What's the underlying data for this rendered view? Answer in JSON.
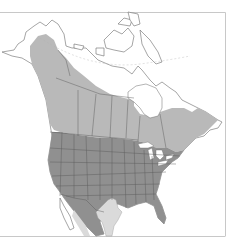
{
  "map": {
    "type": "species-range-map",
    "region": "North America",
    "background_color": "#ffffff",
    "outline_color": "#5a5a5a",
    "frame_color": "#c8c8c8",
    "zones": [
      {
        "id": "northern-range",
        "description": "Canada and Alaska range",
        "color": "#b9b9b9"
      },
      {
        "id": "core-range",
        "description": "Contiguous United States range",
        "color": "#909090"
      },
      {
        "id": "southern-range",
        "description": "Texas / northern Mexico range",
        "color": "#dadada"
      }
    ]
  }
}
